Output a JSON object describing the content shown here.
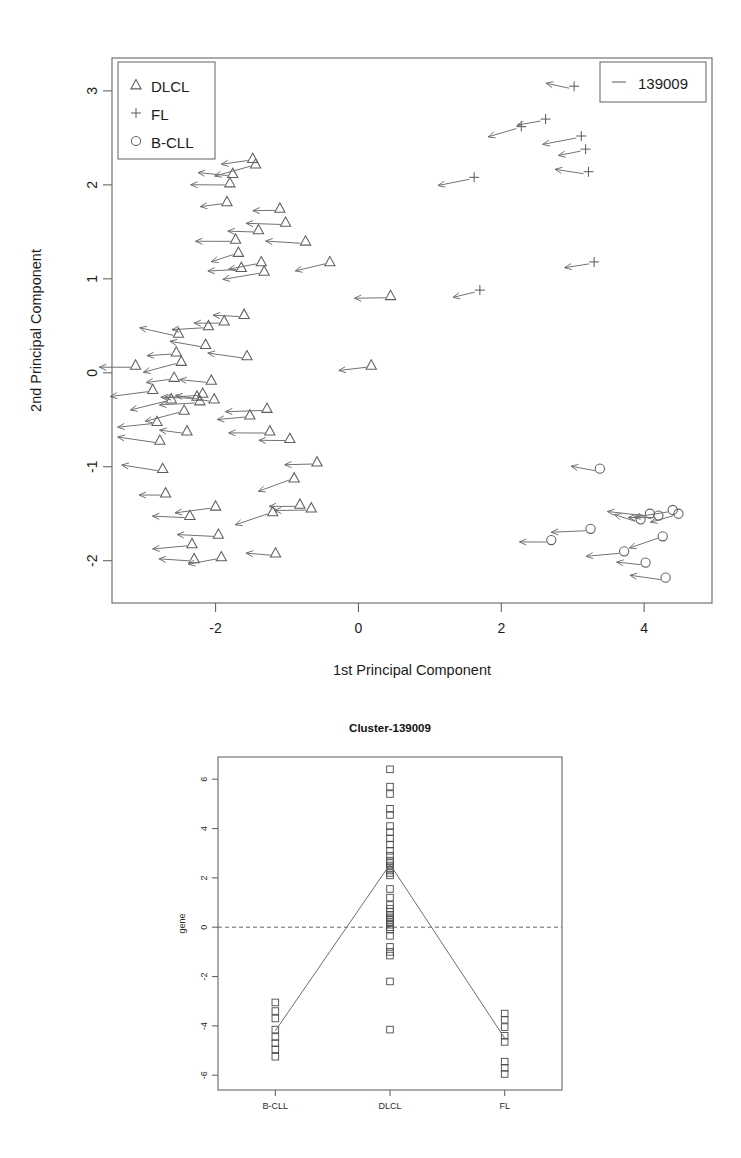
{
  "figure": {
    "panels": [
      "pca-biplot",
      "cluster-profile"
    ]
  },
  "pca": {
    "xlabel": "1st Principal Component",
    "ylabel": "2nd Principal Component",
    "xticks": [
      "-2",
      "0",
      "2",
      "4"
    ],
    "xtick_values": [
      -2,
      0,
      2,
      4
    ],
    "yticks": [
      "-2",
      "-1",
      "0",
      "1",
      "2",
      "3"
    ],
    "ytick_values": [
      -2,
      -1,
      0,
      1,
      2,
      3
    ],
    "xlim": [
      -3.45,
      4.95
    ],
    "ylim": [
      -2.45,
      3.35
    ],
    "group_legend": {
      "items": [
        {
          "label": "DLCL",
          "symbol": "triangle"
        },
        {
          "label": "FL",
          "symbol": "plus"
        },
        {
          "label": "B-CLL",
          "symbol": "circle"
        }
      ]
    },
    "cluster_legend": {
      "label": "139009",
      "symbol": "dash"
    },
    "arrow_color": "#6a6a6a",
    "marker_color": "#5e5e5e"
  },
  "profile": {
    "title": "Cluster-139009",
    "ylabel": "gene",
    "yticks": [
      "-6",
      "-4",
      "-2",
      "0",
      "2",
      "4",
      "6"
    ],
    "ytick_values": [
      -6,
      -4,
      -2,
      0,
      2,
      4,
      6
    ],
    "xticks": [
      "B-CLL",
      "DLCL",
      "FL"
    ],
    "ylim": [
      -6.6,
      6.9
    ],
    "zero_reference": 0,
    "mean_values": [
      -4.2,
      2.55,
      -4.5
    ]
  },
  "chart_data": [
    {
      "type": "scatter",
      "id": "pca-biplot",
      "title": "",
      "xlabel": "1st Principal Component",
      "ylabel": "2nd Principal Component",
      "xlim": [
        -3.45,
        4.95
      ],
      "ylim": [
        -2.45,
        3.35
      ],
      "grid": false,
      "legend_position": "top-left",
      "annotation": "Each point carries a leftward gene-loading arrow for cluster 139009",
      "series": [
        {
          "name": "DLCL",
          "marker": "triangle",
          "points": [
            [
              -3.12,
              0.08
            ],
            [
              -2.88,
              -0.18
            ],
            [
              -2.82,
              -0.52
            ],
            [
              -2.78,
              -0.72
            ],
            [
              -2.74,
              -1.02
            ],
            [
              -2.7,
              -1.28
            ],
            [
              -2.62,
              -0.28
            ],
            [
              -2.58,
              -0.05
            ],
            [
              -2.55,
              0.22
            ],
            [
              -2.52,
              0.42
            ],
            [
              -2.48,
              0.12
            ],
            [
              -2.44,
              -0.4
            ],
            [
              -2.4,
              -0.62
            ],
            [
              -2.36,
              -1.52
            ],
            [
              -2.33,
              -1.82
            ],
            [
              -2.3,
              -1.98
            ],
            [
              -2.26,
              -0.25
            ],
            [
              -2.22,
              -0.3
            ],
            [
              -2.18,
              -0.22
            ],
            [
              -2.14,
              0.3
            ],
            [
              -2.1,
              0.5
            ],
            [
              -2.06,
              -0.08
            ],
            [
              -2.02,
              -0.28
            ],
            [
              -2.0,
              -1.42
            ],
            [
              -1.96,
              -1.72
            ],
            [
              -1.92,
              -1.96
            ],
            [
              -1.88,
              0.55
            ],
            [
              -1.84,
              1.82
            ],
            [
              -1.8,
              2.02
            ],
            [
              -1.76,
              2.12
            ],
            [
              -1.72,
              1.42
            ],
            [
              -1.68,
              1.28
            ],
            [
              -1.64,
              1.12
            ],
            [
              -1.6,
              0.62
            ],
            [
              -1.56,
              0.18
            ],
            [
              -1.52,
              -0.45
            ],
            [
              -1.48,
              2.28
            ],
            [
              -1.44,
              2.22
            ],
            [
              -1.4,
              1.52
            ],
            [
              -1.36,
              1.18
            ],
            [
              -1.32,
              1.08
            ],
            [
              -1.28,
              -0.38
            ],
            [
              -1.24,
              -0.62
            ],
            [
              -1.2,
              -1.48
            ],
            [
              -1.16,
              -1.92
            ],
            [
              -1.1,
              1.75
            ],
            [
              -1.02,
              1.6
            ],
            [
              -0.96,
              -0.7
            ],
            [
              -0.9,
              -1.12
            ],
            [
              -0.82,
              -1.4
            ],
            [
              -0.74,
              1.4
            ],
            [
              -0.66,
              -1.44
            ],
            [
              -0.58,
              -0.95
            ],
            [
              -0.4,
              1.18
            ],
            [
              0.18,
              0.08
            ],
            [
              0.45,
              0.82
            ]
          ]
        },
        {
          "name": "FL",
          "marker": "plus",
          "points": [
            [
              1.62,
              2.08
            ],
            [
              1.7,
              0.88
            ],
            [
              2.28,
              2.62
            ],
            [
              2.62,
              2.7
            ],
            [
              3.02,
              3.05
            ],
            [
              3.12,
              2.52
            ],
            [
              3.18,
              2.38
            ],
            [
              3.22,
              2.14
            ],
            [
              3.3,
              1.18
            ]
          ]
        },
        {
          "name": "B-CLL",
          "marker": "circle",
          "points": [
            [
              2.7,
              -1.78
            ],
            [
              3.25,
              -1.66
            ],
            [
              3.38,
              -1.02
            ],
            [
              3.72,
              -1.9
            ],
            [
              3.95,
              -1.56
            ],
            [
              4.02,
              -2.02
            ],
            [
              4.08,
              -1.5
            ],
            [
              4.2,
              -1.52
            ],
            [
              4.26,
              -1.74
            ],
            [
              4.3,
              -2.18
            ],
            [
              4.4,
              -1.46
            ],
            [
              4.48,
              -1.5
            ]
          ]
        }
      ]
    },
    {
      "type": "scatter",
      "id": "cluster-profile",
      "title": "Cluster-139009",
      "xlabel": "",
      "ylabel": "gene",
      "categories": [
        "B-CLL",
        "DLCL",
        "FL"
      ],
      "ylim": [
        -6.6,
        6.9
      ],
      "grid": false,
      "legend_position": "none",
      "zero_reference_line": 0,
      "series": [
        {
          "name": "B-CLL",
          "marker": "open-square",
          "values": [
            -3.05,
            -3.4,
            -3.7,
            -4.15,
            -4.45,
            -4.7,
            -4.95,
            -5.25
          ]
        },
        {
          "name": "DLCL",
          "marker": "open-square",
          "values": [
            6.4,
            5.7,
            5.4,
            4.8,
            4.55,
            4.1,
            3.85,
            3.6,
            3.35,
            3.1,
            2.9,
            2.7,
            2.6,
            2.5,
            2.4,
            2.3,
            2.2,
            2.1,
            1.55,
            1.2,
            0.9,
            0.75,
            0.62,
            0.5,
            0.4,
            0.3,
            0.2,
            0.1,
            0.0,
            -0.1,
            -0.35,
            -0.8,
            -1.0,
            -1.15,
            -2.2,
            -4.15
          ]
        },
        {
          "name": "FL",
          "marker": "open-square",
          "values": [
            -3.5,
            -3.75,
            -4.05,
            -4.4,
            -4.65,
            -5.45,
            -5.7,
            -5.95
          ]
        }
      ],
      "mean_profile": {
        "name": "cluster mean",
        "categories": [
          "B-CLL",
          "DLCL",
          "FL"
        ],
        "values": [
          -4.2,
          2.55,
          -4.5
        ]
      }
    }
  ]
}
